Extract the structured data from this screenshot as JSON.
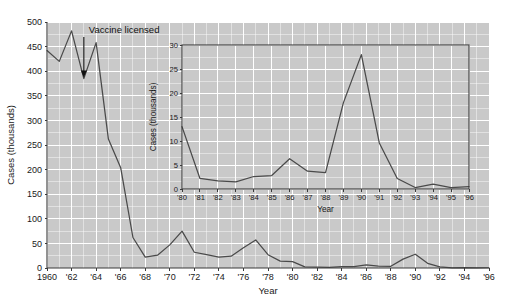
{
  "figure": {
    "title": "",
    "annotation": {
      "label": "Vaccine licensed",
      "at_year": 1963,
      "at_value": 385,
      "icon": "down-arrow-icon"
    }
  },
  "chart_data": [
    {
      "type": "line",
      "id": "main-chart",
      "title": "",
      "xlabel": "Year",
      "ylabel": "Cases (thousands)",
      "xlim": [
        1960,
        1996
      ],
      "ylim": [
        0,
        500
      ],
      "yticks": [
        0,
        50,
        100,
        150,
        200,
        250,
        300,
        350,
        400,
        450,
        500
      ],
      "ytick_labels": [
        "0",
        "50",
        "100",
        "150",
        "200",
        "250",
        "300",
        "350",
        "400",
        "450",
        "500"
      ],
      "xticks": [
        1960,
        1962,
        1964,
        1966,
        1968,
        1970,
        1972,
        1974,
        1976,
        1978,
        1980,
        1982,
        1984,
        1986,
        1988,
        1990,
        1992,
        1994,
        1996
      ],
      "xtick_labels": [
        "1960",
        "'62",
        "'64",
        "'66",
        "'68",
        "'70",
        "'72",
        "'74",
        "'76",
        "'78",
        "'80",
        "'82",
        "'84",
        "'86",
        "'88",
        "'90",
        "'92",
        "'94",
        "'96"
      ],
      "grid": true,
      "legend": "none",
      "x": [
        1960,
        1961,
        1962,
        1963,
        1964,
        1965,
        1966,
        1967,
        1968,
        1969,
        1970,
        1971,
        1972,
        1973,
        1974,
        1975,
        1976,
        1977,
        1978,
        1979,
        1980,
        1981,
        1982,
        1983,
        1984,
        1985,
        1986,
        1987,
        1988,
        1989,
        1990,
        1991,
        1992,
        1993,
        1994,
        1995,
        1996
      ],
      "values": [
        442,
        420,
        482,
        385,
        458,
        262,
        204,
        62,
        22,
        26,
        47,
        75,
        32,
        27,
        22,
        24,
        41,
        57,
        27,
        14,
        13,
        2.2,
        1.7,
        1.5,
        2.6,
        2.8,
        6.3,
        3.7,
        3.4,
        18,
        28,
        9.6,
        2.2,
        0.3,
        1,
        0.3,
        0.5
      ]
    },
    {
      "type": "line",
      "id": "inset-chart",
      "title": "",
      "xlabel": "Year",
      "ylabel": "Cases (thousands)",
      "xlim": [
        1980,
        1996
      ],
      "ylim": [
        0,
        30
      ],
      "yticks": [
        0,
        5,
        10,
        15,
        20,
        25,
        30
      ],
      "ytick_labels": [
        "0",
        "5",
        "10",
        "15",
        "20",
        "25",
        "30"
      ],
      "xticks": [
        1980,
        1981,
        1982,
        1983,
        1984,
        1985,
        1986,
        1987,
        1988,
        1989,
        1990,
        1991,
        1992,
        1993,
        1994,
        1995,
        1996
      ],
      "xtick_labels": [
        "'80",
        "'81",
        "'82",
        "'83",
        "'84",
        "'85",
        "'86",
        "'87",
        "'88",
        "'89",
        "'90",
        "'91",
        "'92",
        "'93",
        "'94",
        "'95",
        "'96"
      ],
      "grid": true,
      "legend": "none",
      "x": [
        1980,
        1981,
        1982,
        1983,
        1984,
        1985,
        1986,
        1987,
        1988,
        1989,
        1990,
        1991,
        1992,
        1993,
        1994,
        1995,
        1996
      ],
      "values": [
        13,
        2.2,
        1.7,
        1.5,
        2.6,
        2.8,
        6.3,
        3.7,
        3.4,
        18,
        28,
        9.6,
        2.2,
        0.3,
        1,
        0.3,
        0.5
      ]
    }
  ],
  "colors": {
    "plot_background": "#c9c9c9",
    "grid": "#ffffff",
    "series": "#4a4a4a",
    "axis": "#3a3a3a",
    "page_background": "#ffffff"
  }
}
